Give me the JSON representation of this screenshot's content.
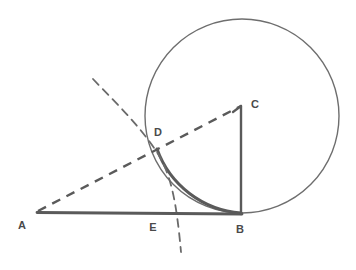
{
  "figure": {
    "kind": "geometry-construction-diagram",
    "width": 356,
    "height": 270,
    "background_color": "#ffffff",
    "stroke_color": "#5a5a5a",
    "circle_stroke_color": "#6e6e6e",
    "label_color": "#4a4a4a",
    "labels": {
      "a": "A",
      "b": "B",
      "c": "C",
      "d": "D",
      "e": "E"
    },
    "points": {
      "A": {
        "x": 37,
        "y": 212
      },
      "B": {
        "x": 241,
        "y": 213
      },
      "C": {
        "x": 241,
        "y": 106
      },
      "D": {
        "x": 157,
        "y": 149
      },
      "E": {
        "x": 170,
        "y": 213
      }
    },
    "label_positions": {
      "A": {
        "x": 22,
        "y": 228
      },
      "B": {
        "x": 237,
        "y": 232
      },
      "C": {
        "x": 253,
        "y": 107
      },
      "D": {
        "x": 157,
        "y": 136
      },
      "E": {
        "x": 152,
        "y": 230
      }
    },
    "circle": {
      "cx": 242,
      "cy": 116,
      "r": 97,
      "stroke_width": 1.4
    },
    "segments": [
      {
        "name": "AB",
        "from": "A",
        "to": "B",
        "style": "solid",
        "stroke_width": 2.6
      },
      {
        "name": "BC",
        "from": "B",
        "to": "C",
        "style": "solid",
        "stroke_width": 2.2
      },
      {
        "name": "AC",
        "from": "A",
        "to": "C",
        "style": "dashed",
        "stroke_width": 2.4,
        "dash": "9 7"
      }
    ],
    "arcs": [
      {
        "name": "arc-DB-on-circle",
        "style": "solid",
        "stroke_width": 2.8,
        "description": "bold circle arc from D to B"
      },
      {
        "name": "compass-arc-through-D-and-E",
        "style": "dashed",
        "stroke_width": 1.8,
        "dash": "8 6",
        "description": "dashed construction arc centred near A passing through D and E"
      }
    ]
  }
}
